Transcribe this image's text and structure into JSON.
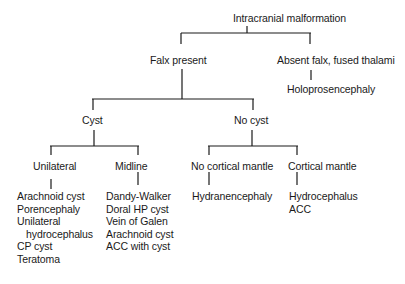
{
  "diagram": {
    "type": "decision-tree",
    "root": "Intracranial malformation",
    "level1": {
      "left": "Falx present",
      "right": "Absent falx, fused thalami",
      "right_child": "Holoprosencephaly"
    },
    "level2": {
      "left": "Cyst",
      "right": "No cyst"
    },
    "level3": {
      "unilateral": "Unilateral",
      "midline": "Midline",
      "no_cortical": "No cortical mantle",
      "cortical": "Cortical mantle"
    },
    "leaves": {
      "unilateral": [
        "Arachnoid cyst",
        "Porencephaly",
        "Unilateral",
        "hydrocephalus",
        "CP cyst",
        "Teratoma"
      ],
      "midline": [
        "Dandy-Walker",
        "Doral HP cyst",
        "Vein of Galen",
        "Arachnoid cyst",
        "ACC with cyst"
      ],
      "no_cortical": [
        "Hydranencephaly"
      ],
      "cortical": [
        "Hydrocephalus",
        "ACC"
      ]
    },
    "line_color": "#1a1a1a"
  }
}
